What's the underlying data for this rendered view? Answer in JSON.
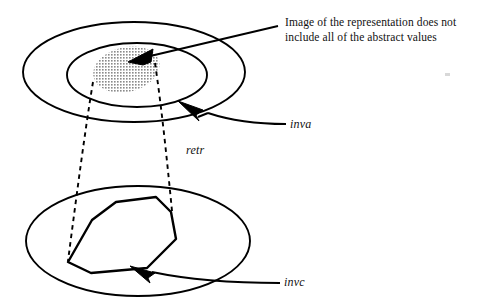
{
  "figure": {
    "type": "set-mapping-diagram",
    "caption": "Image of the representation  does not include all of the abstract values",
    "labels": {
      "abstract_set": "inva",
      "retrieve_map": "retr",
      "concrete_set": "invc"
    },
    "colors": {
      "stroke": "#000000",
      "blob_fill": "#b3b3b3",
      "background": "#ffffff",
      "speck": "#d8d8d8"
    },
    "shapes": {
      "outer_ellipse_upper": {
        "cx": 134,
        "cy": 72,
        "rx": 111,
        "ry": 50
      },
      "inner_ellipse_upper": {
        "cx": 137,
        "cy": 75,
        "rx": 70,
        "ry": 32
      },
      "lower_ellipse": {
        "cx": 138,
        "cy": 241,
        "rx": 112,
        "ry": 55
      },
      "image_blob": "tilted shaded oval inside inner upper ellipse",
      "concrete_polygon": "irregular octagon inside lower ellipse",
      "dashed_connectors": 2
    },
    "arrows": {
      "caption_arrow": "points from caption down-left into shaded blob",
      "inva_arrow": "points up-left at inner upper ellipse boundary",
      "invc_arrow": "points up-left at lower polygon boundary"
    }
  }
}
